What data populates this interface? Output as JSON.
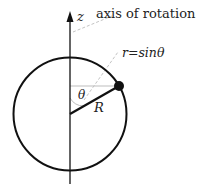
{
  "diagram": {
    "axis_label": "z",
    "axis_annotation": "axis of rotation",
    "radius_annotation": "r=sinθ",
    "angle_label": "θ",
    "radius_label": "R",
    "colors": {
      "stroke": "#111111",
      "guide": "#bbbbbb",
      "text": "#222222"
    }
  }
}
